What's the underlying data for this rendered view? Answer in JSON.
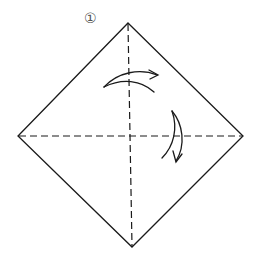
{
  "diagram": {
    "step_number": "①",
    "colors": {
      "line": "#1a1a1a",
      "marker": "#555555",
      "background": "#ffffff"
    },
    "vertices": {
      "top": [
        128,
        23
      ],
      "right": [
        243,
        136
      ],
      "bottom": [
        132,
        247
      ],
      "left": [
        18,
        136
      ]
    },
    "creases": [
      {
        "type": "valley-fold",
        "orientation": "vertical",
        "from": "top",
        "to": "bottom"
      },
      {
        "type": "valley-fold",
        "orientation": "horizontal",
        "from": "left",
        "to": "right"
      }
    ],
    "arrows": [
      {
        "name": "fold-left-to-right-arrow",
        "direction": "right"
      },
      {
        "name": "fold-top-to-bottom-arrow",
        "direction": "down"
      }
    ]
  }
}
